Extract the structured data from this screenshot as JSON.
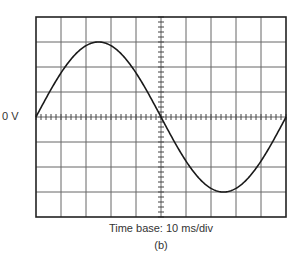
{
  "figure": {
    "zero_label": "0 V",
    "timebase_label": "Time base: 10 ms/div",
    "caption": "(b)"
  },
  "colors": {
    "grid": "#666666",
    "frame": "#222222",
    "trace": "#1a1a1a",
    "text": "#333333"
  },
  "chart_data": {
    "type": "line",
    "title": "",
    "xlabel": "Time base: 10 ms/div",
    "ylabel": "",
    "grid": true,
    "x_divisions": 10,
    "y_divisions": 8,
    "time_per_div_ms": 10,
    "reference_label": "0 V",
    "waveform": "sine",
    "amplitude_divisions": 3,
    "period_divisions": 10,
    "period_ms": 100,
    "x": [
      0,
      12.5,
      25,
      37.5,
      50,
      62.5,
      75,
      87.5,
      100
    ],
    "values_div": [
      0,
      2.12,
      3,
      2.12,
      0,
      -2.12,
      -3,
      -2.12,
      0
    ],
    "xlim_ms": [
      0,
      100
    ],
    "ylim_div": [
      -4,
      4
    ]
  }
}
